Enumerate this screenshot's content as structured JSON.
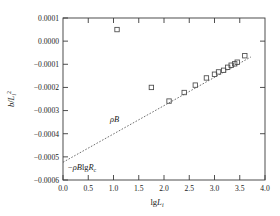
{
  "chart_data": {
    "type": "scatter",
    "title": "",
    "xlabel": "lgL_i",
    "ylabel": "b/L_i^2",
    "xlabel_parts": {
      "prefix": "lg",
      "italic": "L",
      "sub": "i"
    },
    "ylabel_parts": {
      "num_italic": "b",
      "slash": "/",
      "den_italic": "L",
      "den_sub": "i",
      "den_sup": "2"
    },
    "xlim": [
      0.0,
      4.0
    ],
    "ylim": [
      -0.0006,
      0.0001
    ],
    "xticks": [
      0.0,
      0.5,
      1.0,
      1.5,
      2.0,
      2.5,
      3.0,
      3.5,
      4.0
    ],
    "xticklabels": [
      "0.0",
      "0.5",
      "1.0",
      "1.5",
      "2.0",
      "2.5",
      "3.0",
      "3.5",
      "4.0"
    ],
    "yticks": [
      0.0001,
      0.0,
      -0.0001,
      -0.0002,
      -0.0003,
      -0.0004,
      -0.0005,
      -0.0006
    ],
    "yticklabels": [
      "0.0001",
      "0.0000",
      "−0.0001",
      "−0.0002",
      "−0.0003",
      "−0.0004",
      "−0.0005",
      "−0.0006"
    ],
    "grid": false,
    "legend": false,
    "marker": "open-square",
    "series": [
      {
        "name": "data",
        "points": [
          [
            1.07,
            5e-05
          ],
          [
            1.75,
            -0.0002
          ],
          [
            2.1,
            -0.000259
          ],
          [
            2.4,
            -0.000222
          ],
          [
            2.62,
            -0.00019
          ],
          [
            2.84,
            -0.000159
          ],
          [
            3.0,
            -0.000143
          ],
          [
            3.08,
            -0.000133
          ],
          [
            3.18,
            -0.000126
          ],
          [
            3.26,
            -0.000113
          ],
          [
            3.33,
            -0.000104
          ],
          [
            3.4,
            -9.8e-05
          ],
          [
            3.45,
            -9.1e-05
          ],
          [
            3.6,
            -6.3e-05
          ]
        ]
      }
    ],
    "fit_line": {
      "style": "dotted",
      "x_start": 0.0,
      "y_start": -0.00052,
      "x_end": 3.72,
      "y_end": -6.5e-05,
      "slope_label": "ρB",
      "intercept_label": "−ρBlgR"
    },
    "annotations": [
      {
        "name": "slope-label",
        "text": "ρB",
        "x": 1.5,
        "y": -0.000345
      },
      {
        "name": "intercept-label",
        "text": "−ρBlgR",
        "sub": "c",
        "x": 0.22,
        "y": -0.000545
      }
    ]
  }
}
